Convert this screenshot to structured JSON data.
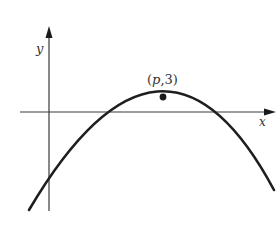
{
  "diagram": {
    "type": "parabola-graph",
    "axes": {
      "x_label": "x",
      "y_label": "y"
    },
    "vertex": {
      "label_open": "(",
      "label_var": "p",
      "label_sep": ",",
      "label_value": "3",
      "label_close": ")",
      "x_symbol": "p",
      "y": 3
    },
    "curve": {
      "shape": "downward-opening parabola",
      "y_intercept_sign": "negative",
      "x_intercepts": 2
    },
    "colors": {
      "curve": "#1e1e1e",
      "axes": "#3a3a3a",
      "background": "#ffffff"
    }
  }
}
